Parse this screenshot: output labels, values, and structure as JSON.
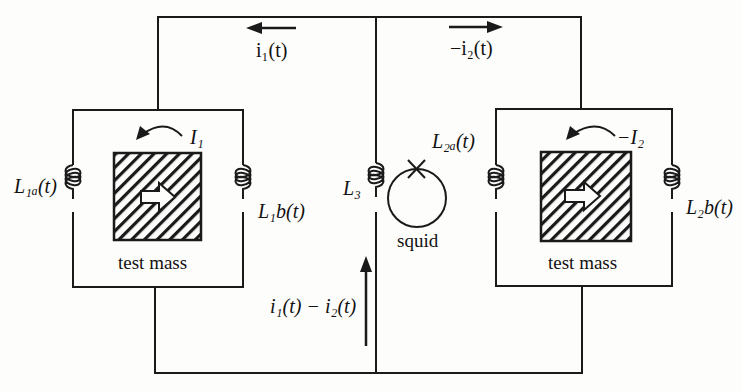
{
  "diagram": {
    "labels": {
      "i1": "i₁(t)",
      "minus_i2": "−i₂(t)",
      "I1": "I₁",
      "minus_I2": "−I₂",
      "L1a": "L₁ₐ(t)",
      "L1b": "L₁b(t)",
      "L3": "L₃",
      "L2a": "L₂ₐ(t)",
      "L2b": "L₂b(t)",
      "i1_minus_i2": "i₁(t) − i₂(t)",
      "squid": "squid",
      "test_mass_left": "test mass",
      "test_mass_right": "test mass"
    },
    "colors": {
      "line": "#1a1a1a",
      "background": "#fdfdfb"
    }
  }
}
